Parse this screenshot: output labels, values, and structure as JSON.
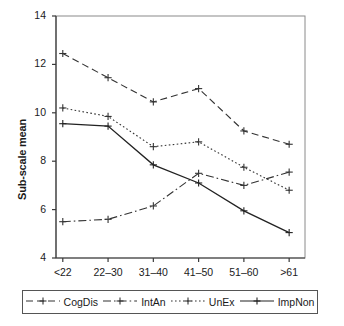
{
  "chart_data": {
    "type": "line",
    "title": "",
    "xlabel": "",
    "ylabel": "Sub-scale mean",
    "categories": [
      "<22",
      "22–30",
      "31–40",
      "41–50",
      "51–60",
      ">61"
    ],
    "ylim": [
      4,
      14
    ],
    "yticks": [
      4,
      6,
      8,
      10,
      12,
      14
    ],
    "ytick_labels": [
      "4",
      "6",
      "8",
      "10",
      "12",
      "14"
    ],
    "grid": false,
    "legend_position": "bottom",
    "marker": "plus",
    "series": [
      {
        "name": "CogDis",
        "values": [
          12.45,
          11.45,
          10.45,
          11.0,
          9.25,
          8.7
        ],
        "linestyle": "dashed",
        "color": "#333333"
      },
      {
        "name": "IntAn",
        "values": [
          5.5,
          5.6,
          6.15,
          7.5,
          7.0,
          7.55
        ],
        "linestyle": "dashdot",
        "color": "#333333"
      },
      {
        "name": "UnEx",
        "values": [
          10.2,
          9.85,
          8.6,
          8.8,
          7.75,
          6.8
        ],
        "linestyle": "dotted",
        "color": "#333333"
      },
      {
        "name": "ImpNon",
        "values": [
          9.55,
          9.45,
          7.85,
          7.1,
          5.95,
          5.05
        ],
        "linestyle": "solid",
        "color": "#222222"
      }
    ]
  },
  "axes": {
    "y_title": "Sub-scale mean"
  },
  "legend": {
    "items": [
      {
        "label": "CogDis"
      },
      {
        "label": "IntAn"
      },
      {
        "label": "UnEx"
      },
      {
        "label": "ImpNon"
      }
    ]
  }
}
